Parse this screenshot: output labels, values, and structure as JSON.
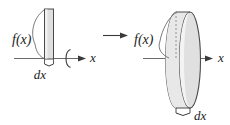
{
  "figure": {
    "name": "disk-method-volume-of-revolution",
    "colors": {
      "stroke": "#3a3a3a",
      "axis": "#6b6b6b",
      "fill_light": "#e2e2e2",
      "fill_mid": "#d2d2d2",
      "fill_dark": "#bfbfbf",
      "background": "#ffffff",
      "dashed": "#8a8a8a"
    },
    "left_panel": {
      "name": "rectangle-strip-before-rotation",
      "height_label": "f(x)",
      "width_label": "dx",
      "axis_label": "x",
      "rotation_hint": "revolve-arc"
    },
    "transition": {
      "arrow_glyph": "→"
    },
    "right_panel": {
      "name": "disk-after-rotation",
      "radius_label": "f(x)",
      "thickness_label": "dx",
      "axis_label": "x"
    }
  }
}
